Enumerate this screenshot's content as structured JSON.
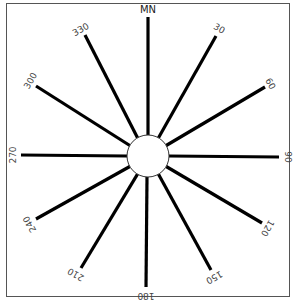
{
  "diagram": {
    "type": "compass-rose",
    "center": {
      "x": 148,
      "y": 156
    },
    "hub_radius": 21,
    "north_label": "MN",
    "spokes": [
      {
        "angle": 0,
        "label": "MN",
        "x2": 148,
        "y2": 17
      },
      {
        "angle": 30,
        "label": "30",
        "x2": 216,
        "y2": 36
      },
      {
        "angle": 60,
        "label": "60",
        "x2": 265,
        "y2": 87
      },
      {
        "angle": 90,
        "label": "90",
        "x2": 279,
        "y2": 157
      },
      {
        "angle": 120,
        "label": "120",
        "x2": 262,
        "y2": 223
      },
      {
        "angle": 150,
        "label": "150",
        "x2": 211,
        "y2": 270
      },
      {
        "angle": 180,
        "label": "180",
        "x2": 146,
        "y2": 287
      },
      {
        "angle": 210,
        "label": "210",
        "x2": 81,
        "y2": 268
      },
      {
        "angle": 240,
        "label": "240",
        "x2": 36,
        "y2": 219
      },
      {
        "angle": 270,
        "label": "270",
        "x2": 21,
        "y2": 155
      },
      {
        "angle": 300,
        "label": "300",
        "x2": 36,
        "y2": 86
      },
      {
        "angle": 330,
        "label": "330",
        "x2": 85,
        "y2": 35
      }
    ],
    "colors": {
      "spoke": "#000000",
      "frame": "#555555",
      "label": "#444444",
      "background": "#ffffff"
    }
  }
}
